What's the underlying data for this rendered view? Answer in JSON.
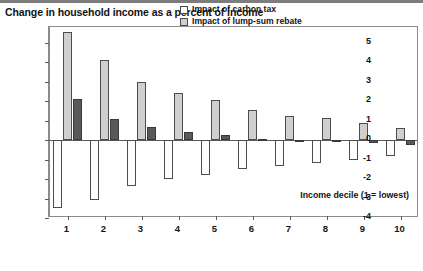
{
  "chart_title": "Change in household income as a percent of income",
  "legend": {
    "position": "top-right-inside",
    "items": [
      {
        "label": "Impact of carbon tax",
        "color": "#fdfdfd",
        "name": "carbon-tax"
      },
      {
        "label": "Impact of lump-sum rebate",
        "color": "#cfcfcf",
        "name": "lump-sum-rebate"
      },
      {
        "label": "Net impact of carbon tax and rebate",
        "color": "#595959",
        "name": "net-impact"
      }
    ]
  },
  "axes": {
    "x_caption": "Income decile (1 = lowest)",
    "y_ticks": [
      "5",
      "4",
      "3",
      "2",
      "1",
      "0",
      "-1",
      "-2",
      "-3",
      "-4"
    ],
    "x_ticks": [
      "1",
      "2",
      "3",
      "4",
      "5",
      "6",
      "7",
      "8",
      "9",
      "10"
    ]
  },
  "chart_data": {
    "type": "bar",
    "title": "Change in household income as a percent of income",
    "xlabel": "Income decile (1 = lowest)",
    "ylabel": "",
    "ylim": [
      -4,
      5.8
    ],
    "yticks": [
      5,
      4,
      3,
      2,
      1,
      0,
      -1,
      -2,
      -3,
      -4
    ],
    "grid": false,
    "legend_position": "upper right",
    "categories": [
      "1",
      "2",
      "3",
      "4",
      "5",
      "6",
      "7",
      "8",
      "9",
      "10"
    ],
    "series": [
      {
        "name": "Impact of carbon tax",
        "color": "#fdfdfd",
        "values": [
          -3.5,
          -3.1,
          -2.35,
          -2.0,
          -1.8,
          -1.5,
          -1.35,
          -1.2,
          -1.0,
          -0.8
        ]
      },
      {
        "name": "Impact of lump-sum rebate",
        "color": "#cfcfcf",
        "values": [
          5.55,
          4.1,
          3.0,
          2.4,
          2.05,
          1.55,
          1.25,
          1.15,
          0.9,
          0.6
        ]
      },
      {
        "name": "Net impact of carbon tax and rebate",
        "color": "#595959",
        "values": [
          2.1,
          1.1,
          0.65,
          0.4,
          0.25,
          0.05,
          -0.1,
          -0.1,
          -0.15,
          -0.25
        ]
      }
    ]
  }
}
